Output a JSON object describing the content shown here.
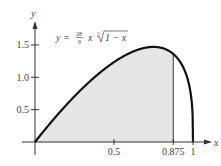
{
  "chart_data": {
    "type": "area",
    "title": "",
    "equation": {
      "lhs": "y =",
      "frac_num": "28",
      "frac_den": "9",
      "var": "x",
      "root_index": "3",
      "radicand": "1 − x"
    },
    "xlabel": "x",
    "ylabel": "y",
    "xlim": [
      0,
      1.05
    ],
    "ylim": [
      0,
      1.8
    ],
    "x_ticks": [
      {
        "value": 0.5,
        "label": "0.5"
      },
      {
        "value": 0.875,
        "label": "0.875"
      },
      {
        "value": 1,
        "label": "1"
      }
    ],
    "y_ticks": [
      {
        "value": 0.5,
        "label": "0.5"
      },
      {
        "value": 1.0,
        "label": "1.0"
      },
      {
        "value": 1.5,
        "label": "1.5"
      }
    ],
    "shaded_region": {
      "from": 0,
      "to": 0.875,
      "color": "#e6e6e6"
    },
    "series": [
      {
        "name": "y = (28/9) x ∛(1−x)",
        "x": [
          0,
          0.1,
          0.2,
          0.3,
          0.4,
          0.5,
          0.6,
          0.7,
          0.75,
          0.8,
          0.875,
          0.9,
          0.95,
          0.99,
          1
        ],
        "values": [
          0,
          0.3,
          0.58,
          0.83,
          1.05,
          1.23,
          1.37,
          1.46,
          1.47,
          1.46,
          1.36,
          1.3,
          1.09,
          0.66,
          0
        ]
      }
    ],
    "grid": false
  }
}
